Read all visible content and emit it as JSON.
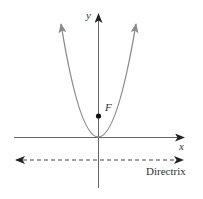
{
  "diagram": {
    "labels": {
      "y_axis": "y",
      "x_axis": "x",
      "focus": "F",
      "directrix": "Directrix"
    },
    "colors": {
      "axis": "#555555",
      "parabola": "#888888",
      "focus": "#111111",
      "directrix": "#444444"
    },
    "elements": {
      "parabola": {
        "vertex": [
          98,
          137
        ],
        "left_tip": [
          61,
          24
        ],
        "right_tip": [
          138,
          23
        ]
      },
      "focus_point": [
        98,
        116
      ],
      "x_axis": {
        "from": [
          14,
          137
        ],
        "to": [
          184,
          137
        ]
      },
      "y_axis": {
        "from": [
          98,
          188
        ],
        "to": [
          98,
          14
        ]
      },
      "directrix": {
        "y": 160,
        "from_x": 15,
        "to_x": 183,
        "style": "dashed",
        "arrows": "both"
      }
    }
  }
}
